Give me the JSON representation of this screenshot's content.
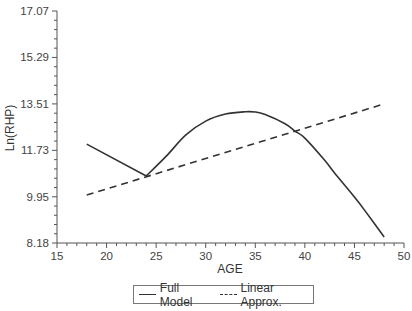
{
  "chart_data": {
    "type": "line",
    "title": "",
    "xlabel": "AGE",
    "ylabel": "Ln(RHP)",
    "xlim": [
      15,
      50
    ],
    "ylim": [
      8.18,
      17.07
    ],
    "x_ticks": [
      15,
      20,
      25,
      30,
      35,
      40,
      45,
      50
    ],
    "y_ticks": [
      8.18,
      9.95,
      11.73,
      13.51,
      15.29,
      17.07
    ],
    "y_tick_labels": [
      "8.18",
      "9.95",
      "11.73",
      "13.51",
      "15.29",
      "17.07"
    ],
    "grid": false,
    "legend_position": "bottom",
    "series": [
      {
        "name": "Full Model",
        "style": "solid",
        "color": "#333333",
        "x": [
          18,
          20,
          22,
          24,
          26,
          28,
          30,
          32,
          34,
          35,
          36,
          38,
          39,
          40,
          42,
          43,
          45,
          46,
          48
        ],
        "y": [
          11.97,
          11.55,
          11.15,
          10.75,
          11.5,
          12.32,
          12.85,
          13.12,
          13.21,
          13.2,
          13.1,
          12.75,
          12.47,
          12.2,
          11.35,
          10.86,
          9.94,
          9.45,
          8.41
        ]
      },
      {
        "name": "Linear Approx.",
        "style": "dashed",
        "color": "#333333",
        "x": [
          18,
          48
        ],
        "y": [
          10.02,
          13.51
        ]
      }
    ]
  },
  "legend": {
    "items": [
      {
        "label": "Full Model",
        "style": "solid"
      },
      {
        "label": "Linear Approx.",
        "style": "dashed"
      }
    ]
  },
  "axes": {
    "x_title": "AGE",
    "y_title": "Ln(RHP)",
    "x_tick_labels": [
      "15",
      "20",
      "25",
      "30",
      "35",
      "40",
      "45",
      "50"
    ],
    "y_tick_labels": [
      "8.18",
      "9.95",
      "11.73",
      "13.51",
      "15.29",
      "17.07"
    ]
  }
}
